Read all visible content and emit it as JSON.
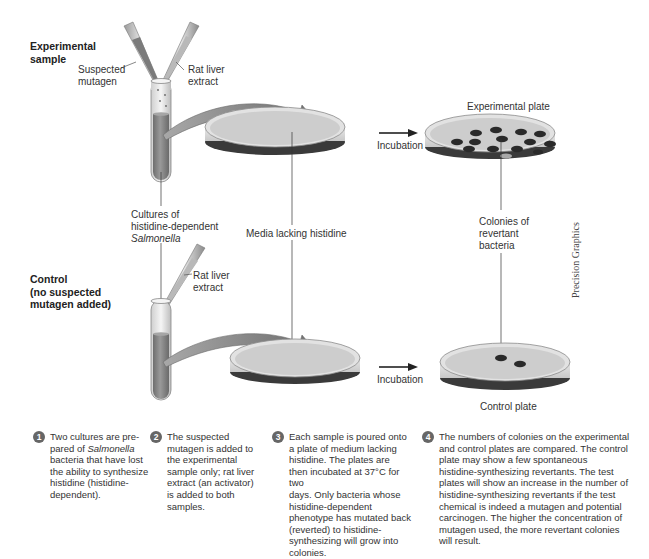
{
  "title_labels": {
    "experimental": "Experimental sample",
    "experimental_line1": "Experimental",
    "experimental_line2": "sample",
    "control_line1": "Control",
    "control_line2": "(no suspected",
    "control_line3": "mutagen added)"
  },
  "labels": {
    "suspected_mutagen_1": "Suspected",
    "suspected_mutagen_2": "mutagen",
    "rat_liver_1": "Rat liver",
    "rat_liver_2": "extract",
    "rat_liver_control_1": "Rat liver",
    "rat_liver_control_2": "extract",
    "cultures_1": "Cultures of",
    "cultures_2": "histidine-dependent",
    "cultures_3": "Salmonella",
    "media": "Media lacking histidine",
    "incubation_top": "Incubation",
    "incubation_bottom": "Incubation",
    "experimental_plate": "Experimental plate",
    "control_plate": "Control plate",
    "colonies_1": "Colonies of",
    "colonies_2": "revertant",
    "colonies_3": "bacteria",
    "credit": "Precision Graphics"
  },
  "colors": {
    "liquid": "#8a8a8a",
    "medium": "#d6d6d6",
    "colony": "#2a2a2a",
    "arrow": "#8c8c8c",
    "step_badge": "#666666"
  },
  "steps": [
    {
      "number": "1",
      "lines": [
        "Two cultures are pre-",
        "pared of ",
        "Salmonella",
        "bacteria that have lost",
        "the ability to synthesize",
        "histidine (histidine-",
        "dependent)."
      ]
    },
    {
      "number": "2",
      "lines": [
        "The suspected",
        "mutagen is added to",
        "the experimental",
        "sample only; rat liver",
        "extract (an activator)",
        "is added to both",
        "samples."
      ]
    },
    {
      "number": "3",
      "lines": [
        "Each sample is poured onto",
        "a plate of medium lacking",
        "histidine. The plates are",
        "then incubated at 37°C for two",
        "days. Only bacteria whose",
        "histidine-dependent",
        "phenotype has mutated back",
        "(reverted) to histidine-",
        "synthesizing will grow into",
        "colonies."
      ]
    },
    {
      "number": "4",
      "lines": [
        "The numbers of colonies on the experimental",
        "and control plates are compared. The control",
        "plate may show a few spontaneous",
        "histidine-synthesizing revertants. The test",
        "plates will show an increase in the number of",
        "histidine-synthesizing revertants if the test",
        "chemical is indeed a mutagen and potential",
        "carcinogen. The higher the concentration of",
        "mutagen used, the more revertant colonies",
        "will result."
      ]
    }
  ],
  "colony_counts": {
    "experimental_plate": 13,
    "control_plate": 2
  }
}
